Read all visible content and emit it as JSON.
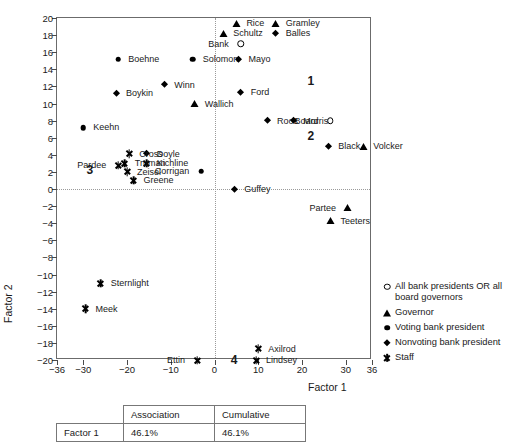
{
  "chart_data": {
    "type": "scatter",
    "title": "",
    "xlabel": "Factor 1",
    "ylabel": "Factor 2",
    "xlim": [
      -36,
      36
    ],
    "ylim": [
      -20,
      20
    ],
    "xticks": [
      -36,
      -30,
      -20,
      -10,
      0,
      10,
      20,
      30,
      36
    ],
    "yticks": [
      20,
      18,
      16,
      14,
      12,
      10,
      8,
      6,
      4,
      2,
      0,
      -2,
      -4,
      -6,
      -8,
      -10,
      -12,
      -14,
      -16,
      -18,
      -20
    ],
    "grid": "dotted reference lines at x=0 and y=0",
    "legend_position": "right-outside",
    "series": [
      {
        "name": "All bank presidents OR all board governors",
        "marker": "circle-open",
        "points": [
          {
            "label": "Bank",
            "x": 6.0,
            "y": 17.0,
            "side": "left"
          },
          {
            "label": "Board",
            "x": 26.5,
            "y": 8.0,
            "side": "left"
          }
        ]
      },
      {
        "name": "Governor",
        "marker": "triangle",
        "points": [
          {
            "label": "Rice",
            "x": 5.0,
            "y": 19.4,
            "side": "right"
          },
          {
            "label": "Gramley",
            "x": 14.0,
            "y": 19.4,
            "side": "right"
          },
          {
            "label": "Schultz",
            "x": 2.0,
            "y": 18.2,
            "side": "right"
          },
          {
            "label": "Wallich",
            "x": -4.5,
            "y": 10.0,
            "side": "right"
          },
          {
            "label": "Volcker",
            "x": 34.0,
            "y": 5.0,
            "side": "right"
          },
          {
            "label": "Partee",
            "x": 30.5,
            "y": -2.2,
            "side": "left"
          },
          {
            "label": "Teeters",
            "x": 26.5,
            "y": -3.7,
            "side": "right"
          }
        ]
      },
      {
        "name": "Voting bank president",
        "marker": "filled-circle",
        "points": [
          {
            "label": "Boehne",
            "x": -22.0,
            "y": 15.2,
            "side": "right"
          },
          {
            "label": "Solomon",
            "x": -5.0,
            "y": 15.2,
            "side": "right"
          },
          {
            "label": "Keehn",
            "x": -30.0,
            "y": 7.2,
            "side": "right"
          },
          {
            "label": "Corrigan",
            "x": -3.0,
            "y": 2.1,
            "side": "left"
          }
        ]
      },
      {
        "name": "Nonvoting bank president",
        "marker": "diamond",
        "points": [
          {
            "label": "Balles",
            "x": 14.0,
            "y": 18.2,
            "side": "right"
          },
          {
            "label": "Mayo",
            "x": 5.5,
            "y": 15.2,
            "side": "right"
          },
          {
            "label": "Winn",
            "x": -11.5,
            "y": 12.2,
            "side": "right"
          },
          {
            "label": "Boykin",
            "x": -22.5,
            "y": 11.2,
            "side": "right"
          },
          {
            "label": "Ford",
            "x": 6.0,
            "y": 11.3,
            "side": "right"
          },
          {
            "label": "Roos",
            "x": 12.0,
            "y": 8.0,
            "side": "right"
          },
          {
            "label": "Morris",
            "x": 18.0,
            "y": 8.0,
            "side": "right"
          },
          {
            "label": "Doyle",
            "x": -15.5,
            "y": 4.1,
            "side": "right"
          },
          {
            "label": "Black",
            "x": 26.0,
            "y": 5.0,
            "side": "right"
          },
          {
            "label": "Guffey",
            "x": 4.5,
            "y": 0.0,
            "side": "right"
          }
        ]
      },
      {
        "name": "Staff",
        "marker": "star",
        "points": [
          {
            "label": "Cross",
            "x": -19.5,
            "y": 4.1,
            "side": "right"
          },
          {
            "label": "Kichline",
            "x": -15.5,
            "y": 3.0,
            "side": "right"
          },
          {
            "label": "Truman",
            "x": -20.5,
            "y": 3.0,
            "side": "right"
          },
          {
            "label": "Pardee",
            "x": -22.0,
            "y": 2.8,
            "side": "left"
          },
          {
            "label": "Zeisel",
            "x": -20.0,
            "y": 2.0,
            "side": "right"
          },
          {
            "label": "Greene",
            "x": -18.5,
            "y": 1.0,
            "side": "right"
          },
          {
            "label": "Sternlight",
            "x": -26.0,
            "y": -11.0,
            "side": "right"
          },
          {
            "label": "Meek",
            "x": -29.5,
            "y": -14.0,
            "side": "right"
          },
          {
            "label": "Axilrod",
            "x": 10.0,
            "y": -18.7,
            "side": "right"
          },
          {
            "label": "Lindsey",
            "x": 9.5,
            "y": -20.0,
            "side": "right"
          },
          {
            "label": "Ettin",
            "x": -4.0,
            "y": -20.0,
            "side": "left"
          }
        ]
      }
    ],
    "cluster_annotations": [
      {
        "text": "1",
        "x": 22.0,
        "y": 12.6
      },
      {
        "text": "2",
        "x": 22.0,
        "y": 6.2
      },
      {
        "text": "3",
        "x": -28.5,
        "y": 2.2
      },
      {
        "text": "4",
        "x": 4.5,
        "y": -20.0
      }
    ]
  },
  "legend": {
    "items": [
      {
        "marker": "circle-open",
        "label": "All bank presidents OR all board governors"
      },
      {
        "marker": "triangle",
        "label": "Governor"
      },
      {
        "marker": "filled-circle",
        "label": "Voting bank president"
      },
      {
        "marker": "diamond",
        "label": "Nonvoting bank president"
      },
      {
        "marker": "star",
        "label": "Staff"
      }
    ]
  },
  "stats_table": {
    "headers": [
      "",
      "Association",
      "Cumulative"
    ],
    "rows": [
      {
        "name": "Factor 1",
        "association": "46.1%",
        "cumulative": "46.1%"
      }
    ]
  }
}
